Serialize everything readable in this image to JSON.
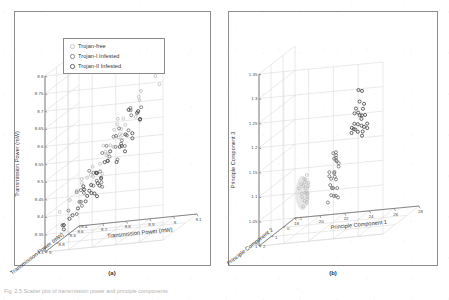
{
  "figure": {
    "caption": "Fig. 2.5 Scatter plot of transmission power and principle components",
    "panel_a_label": "(a)",
    "panel_b_label": "(b)"
  },
  "legend": {
    "items": [
      {
        "label": "Trojan-free",
        "marker": "circle-open-light"
      },
      {
        "label": "Trojan-I Infested",
        "marker": "circle-open-mid"
      },
      {
        "label": "Trojan-II Infested",
        "marker": "circle-open-dark"
      }
    ]
  },
  "chart_data": [
    {
      "type": "scatter",
      "title": "(a)",
      "projection": "3d",
      "xlabel": "Transmission Power (mW)",
      "ylabel": "Transmission Power (mW)",
      "zlabel": "Transmission Power (mW)",
      "xlim": [
        8.6,
        9.1
      ],
      "ylim": [
        8.3,
        8.8
      ],
      "zlim": [
        8.4,
        9.0
      ],
      "xticks": [
        "8.6",
        "8.7",
        "8.8",
        "8.9",
        "9",
        "9.1"
      ],
      "yticks": [
        "8.3",
        "8.35",
        "8.4",
        "8.45",
        "8.5",
        "8.55",
        "8.6",
        "8.65",
        "8.7",
        "8.75",
        "8.8"
      ],
      "zticks": [
        "9",
        "8.8",
        "8.6",
        "8.4"
      ],
      "grid": true,
      "legend_position": "upper-left",
      "note": "Classes overlap heavily along a single diagonal cloud; not separable in raw feature space.",
      "series": [
        {
          "name": "Trojan-free",
          "points": [
            [
              8.64,
              8.4
            ],
            [
              8.66,
              8.42
            ],
            [
              8.67,
              8.44
            ],
            [
              8.69,
              8.46
            ],
            [
              8.7,
              8.45
            ],
            [
              8.71,
              8.48
            ],
            [
              8.72,
              8.47
            ],
            [
              8.73,
              8.5
            ],
            [
              8.74,
              8.49
            ],
            [
              8.75,
              8.52
            ],
            [
              8.76,
              8.51
            ],
            [
              8.77,
              8.54
            ],
            [
              8.78,
              8.53
            ],
            [
              8.79,
              8.56
            ],
            [
              8.8,
              8.55
            ],
            [
              8.81,
              8.58
            ],
            [
              8.82,
              8.57
            ],
            [
              8.83,
              8.6
            ],
            [
              8.84,
              8.59
            ],
            [
              8.85,
              8.62
            ],
            [
              8.86,
              8.61
            ],
            [
              8.87,
              8.64
            ],
            [
              8.88,
              8.63
            ],
            [
              8.9,
              8.66
            ],
            [
              8.92,
              8.68
            ],
            [
              8.94,
              8.7
            ],
            [
              8.96,
              8.72
            ],
            [
              8.99,
              8.75
            ],
            [
              9.01,
              8.71
            ],
            [
              8.68,
              8.43
            ],
            [
              8.74,
              8.46
            ],
            [
              8.78,
              8.5
            ],
            [
              8.82,
              8.54
            ],
            [
              8.86,
              8.58
            ],
            [
              8.9,
              8.62
            ]
          ]
        },
        {
          "name": "Trojan-I Infested",
          "points": [
            [
              8.62,
              8.36
            ],
            [
              8.63,
              8.38
            ],
            [
              8.65,
              8.39
            ],
            [
              8.66,
              8.41
            ],
            [
              8.68,
              8.4
            ],
            [
              8.69,
              8.43
            ],
            [
              8.7,
              8.42
            ],
            [
              8.71,
              8.45
            ],
            [
              8.72,
              8.44
            ],
            [
              8.73,
              8.47
            ],
            [
              8.74,
              8.46
            ],
            [
              8.75,
              8.49
            ],
            [
              8.76,
              8.48
            ],
            [
              8.77,
              8.51
            ],
            [
              8.78,
              8.5
            ],
            [
              8.79,
              8.53
            ],
            [
              8.8,
              8.52
            ],
            [
              8.81,
              8.55
            ],
            [
              8.82,
              8.54
            ],
            [
              8.83,
              8.57
            ],
            [
              8.84,
              8.56
            ],
            [
              8.85,
              8.59
            ],
            [
              8.86,
              8.58
            ],
            [
              8.87,
              8.61
            ],
            [
              8.88,
              8.6
            ],
            [
              8.89,
              8.63
            ],
            [
              8.9,
              8.65
            ],
            [
              8.91,
              8.64
            ],
            [
              8.93,
              8.67
            ],
            [
              8.67,
              8.37
            ],
            [
              8.71,
              8.41
            ],
            [
              8.75,
              8.45
            ],
            [
              8.79,
              8.49
            ],
            [
              8.83,
              8.53
            ],
            [
              8.87,
              8.57
            ]
          ]
        },
        {
          "name": "Trojan-II Infested",
          "points": [
            [
              8.61,
              8.34
            ],
            [
              8.62,
              8.35
            ],
            [
              8.64,
              8.37
            ],
            [
              8.65,
              8.36
            ],
            [
              8.67,
              8.39
            ],
            [
              8.68,
              8.38
            ],
            [
              8.69,
              8.41
            ],
            [
              8.7,
              8.4
            ],
            [
              8.71,
              8.43
            ],
            [
              8.72,
              8.42
            ],
            [
              8.73,
              8.45
            ],
            [
              8.74,
              8.44
            ],
            [
              8.75,
              8.47
            ],
            [
              8.76,
              8.46
            ],
            [
              8.77,
              8.49
            ],
            [
              8.78,
              8.48
            ],
            [
              8.79,
              8.51
            ],
            [
              8.8,
              8.5
            ],
            [
              8.81,
              8.53
            ],
            [
              8.82,
              8.52
            ],
            [
              8.83,
              8.55
            ],
            [
              8.84,
              8.54
            ],
            [
              8.85,
              8.57
            ],
            [
              8.86,
              8.56
            ],
            [
              8.87,
              8.59
            ],
            [
              8.88,
              8.62
            ],
            [
              8.89,
              8.6
            ],
            [
              8.91,
              8.66
            ],
            [
              8.92,
              8.64
            ],
            [
              8.66,
              8.35
            ],
            [
              8.7,
              8.39
            ],
            [
              8.74,
              8.43
            ],
            [
              8.78,
              8.47
            ],
            [
              8.82,
              8.51
            ],
            [
              8.86,
              8.55
            ]
          ]
        }
      ]
    },
    {
      "type": "scatter",
      "title": "(b)",
      "projection": "3d",
      "xlabel": "Principle Component 1",
      "ylabel": "Principle Component 3",
      "zlabel": "Principle Component 2",
      "xlim": [
        18,
        28
      ],
      "ylim": [
        1.0,
        1.35
      ],
      "zlim": [
        -1,
        2
      ],
      "xticks": [
        "18",
        "20",
        "22",
        "24",
        "26",
        "28"
      ],
      "yticks": [
        "1",
        "1.05",
        "1.1",
        "1.15",
        "1.2",
        "1.25",
        "1.3",
        "1.35"
      ],
      "zticks": [
        "2",
        "1",
        "0",
        "-1"
      ],
      "grid": true,
      "legend_position": "upper-left",
      "note": "Three classes form distinct, well-separated clusters after PCA.",
      "series": [
        {
          "name": "Trojan-free",
          "points": [
            [
              19.8,
              1.085
            ],
            [
              19.9,
              1.092
            ],
            [
              20.0,
              1.078
            ],
            [
              20.0,
              1.1
            ],
            [
              20.1,
              1.088
            ],
            [
              20.1,
              1.07
            ],
            [
              20.2,
              1.095
            ],
            [
              20.2,
              1.082
            ],
            [
              20.3,
              1.075
            ],
            [
              20.3,
              1.09
            ],
            [
              20.0,
              1.065
            ],
            [
              20.1,
              1.06
            ],
            [
              20.2,
              1.068
            ],
            [
              19.9,
              1.072
            ],
            [
              20.3,
              1.058
            ],
            [
              20.1,
              1.105
            ],
            [
              20.2,
              1.05
            ],
            [
              20.0,
              1.045
            ],
            [
              20.15,
              1.098
            ],
            [
              20.05,
              1.055
            ]
          ]
        },
        {
          "name": "Trojan-I Infested",
          "points": [
            [
              22.6,
              1.148
            ],
            [
              22.7,
              1.152
            ],
            [
              22.8,
              1.145
            ],
            [
              22.6,
              1.138
            ],
            [
              22.9,
              1.142
            ],
            [
              22.7,
              1.13
            ],
            [
              22.8,
              1.125
            ],
            [
              22.6,
              1.118
            ],
            [
              22.9,
              1.12
            ],
            [
              22.7,
              1.112
            ],
            [
              22.8,
              1.105
            ],
            [
              22.6,
              1.1
            ],
            [
              22.9,
              1.098
            ],
            [
              22.7,
              1.092
            ],
            [
              22.8,
              1.085
            ],
            [
              22.5,
              1.078
            ],
            [
              23.0,
              1.08
            ],
            [
              22.7,
              1.07
            ],
            [
              22.6,
              1.062
            ],
            [
              23.1,
              1.068
            ],
            [
              22.9,
              1.058
            ],
            [
              22.4,
              1.055
            ],
            [
              22.8,
              1.135
            ],
            [
              22.5,
              1.108
            ],
            [
              23.0,
              1.115
            ]
          ]
        },
        {
          "name": "Trojan-II Infested",
          "points": [
            [
              25.1,
              1.282
            ],
            [
              25.3,
              1.278
            ],
            [
              25.0,
              1.255
            ],
            [
              25.2,
              1.25
            ],
            [
              25.1,
              1.245
            ],
            [
              25.3,
              1.24
            ],
            [
              25.0,
              1.235
            ],
            [
              25.2,
              1.23
            ],
            [
              25.1,
              1.225
            ],
            [
              25.3,
              1.222
            ],
            [
              25.0,
              1.218
            ],
            [
              25.2,
              1.215
            ],
            [
              25.1,
              1.21
            ],
            [
              25.3,
              1.208
            ],
            [
              25.0,
              1.205
            ],
            [
              25.2,
              1.2
            ],
            [
              25.1,
              1.198
            ],
            [
              24.9,
              1.212
            ],
            [
              25.4,
              1.226
            ],
            [
              24.95,
              1.238
            ],
            [
              25.35,
              1.195
            ],
            [
              25.05,
              1.19
            ],
            [
              25.25,
              1.186
            ],
            [
              24.9,
              1.202
            ],
            [
              25.4,
              1.205
            ]
          ]
        }
      ]
    }
  ]
}
